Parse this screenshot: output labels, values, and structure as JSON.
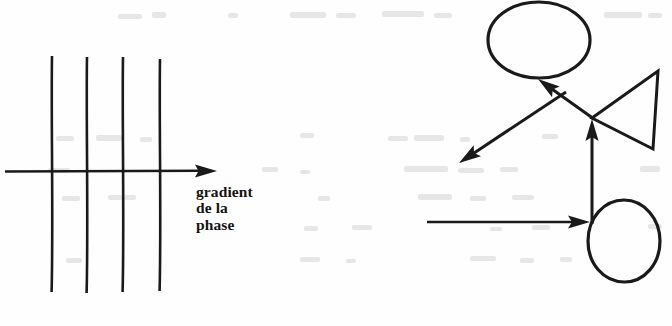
{
  "figure": {
    "background_color": "#fefefe",
    "ink_color": "#1a1a1a",
    "ghost_color": "#e2e2e2",
    "width": 672,
    "height": 326
  },
  "left_diagram": {
    "name": "phase-gradient-diagram",
    "caption": {
      "line1": "gradient",
      "line2": "de la",
      "line3": "phase"
    },
    "axis_arrow": {
      "label": "gradient-axis-arrow",
      "x1": 5,
      "y1": 171,
      "x2": 217,
      "y2": 171,
      "arrowhead": "right"
    },
    "vertical_lines": [
      {
        "label": "phase-line-1",
        "x": 52,
        "y1": 56,
        "y2": 292
      },
      {
        "label": "phase-line-2",
        "x": 87,
        "y1": 57,
        "y2": 293
      },
      {
        "label": "phase-line-3",
        "x": 123,
        "y1": 57,
        "y2": 292
      },
      {
        "label": "phase-line-4",
        "x": 160,
        "y1": 59,
        "y2": 291
      }
    ]
  },
  "right_diagram": {
    "name": "schematic-diagram",
    "upper_ellipse": {
      "label": "upper-ellipse",
      "cx": 539,
      "cy": 40,
      "rx": 51,
      "ry": 38
    },
    "lower_circle": {
      "label": "lower-circle",
      "cx": 624,
      "cy": 241,
      "rx": 36,
      "ry": 41
    },
    "triangle": {
      "label": "left-pointing-triangle",
      "apex_x": 592,
      "apex_y": 118,
      "top_x": 658,
      "top_y": 71,
      "bottom_x": 653,
      "bottom_y": 149
    },
    "arrows": [
      {
        "label": "arrow-down-left",
        "x1": 566,
        "y1": 92,
        "x2": 459,
        "y2": 163,
        "arrowhead": "end"
      },
      {
        "label": "arrow-into-ellipse",
        "x1": 594,
        "y1": 119,
        "x2": 538,
        "y2": 79,
        "arrowhead": "end"
      },
      {
        "label": "arrow-vertical-up",
        "x1": 592,
        "y1": 224,
        "x2": 592,
        "y2": 119,
        "arrowhead": "end"
      },
      {
        "label": "arrow-horizontal-right",
        "x1": 427,
        "y1": 222,
        "x2": 590,
        "y2": 222,
        "arrowhead": "end"
      }
    ]
  }
}
